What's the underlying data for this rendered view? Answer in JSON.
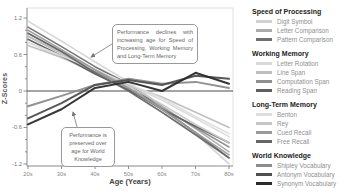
{
  "figure": {
    "y_axis": {
      "label": "Z-Scores",
      "tick_values": [
        1.2,
        0.6,
        0,
        -0.6,
        -1.2
      ],
      "tick_labels": [
        "1.2",
        "0.6",
        "0",
        "-0.6",
        "-1.2"
      ],
      "min": -1.2,
      "max": 1.2
    },
    "x_axis": {
      "label": "Age (Years)",
      "tick_labels": [
        "20s",
        "30s",
        "40s",
        "50s",
        "60s",
        "70s",
        "80s"
      ]
    },
    "annotations": [
      {
        "id": "decline",
        "text": "Performance declines with increasing age for Speed of Processing, Working Memory and Long-Term Memory"
      },
      {
        "id": "preserved",
        "text": "Performance is preserved over age for World Knowledge"
      }
    ],
    "zero_line_color": "#4a4a4a",
    "axis_color": "#999999",
    "frame_color": "#cccccc"
  },
  "chart_data": {
    "type": "line",
    "title": "",
    "xlabel": "Age (Years)",
    "ylabel": "Z-Scores",
    "x": [
      "20s",
      "30s",
      "40s",
      "50s",
      "60s",
      "70s",
      "80s"
    ],
    "ylim": [
      -1.2,
      1.2
    ],
    "grid": false,
    "legend_position": "right",
    "groups": [
      {
        "name": "Speed of Processing",
        "series": [
          {
            "name": "Digit Symbol",
            "color": "#d2d2d2",
            "width": 1.6,
            "values": [
              1.15,
              0.82,
              0.48,
              0.15,
              -0.25,
              -0.7,
              -1.2
            ]
          },
          {
            "name": "Letter Comparison",
            "color": "#ababab",
            "width": 1.6,
            "values": [
              0.95,
              0.65,
              0.35,
              0.1,
              -0.25,
              -0.62,
              -1.0
            ]
          },
          {
            "name": "Pattern Comparison",
            "color": "#6f6f6f",
            "width": 1.6,
            "values": [
              1.05,
              0.73,
              0.4,
              0.12,
              -0.3,
              -0.68,
              -1.1
            ]
          }
        ]
      },
      {
        "name": "Working Memory",
        "series": [
          {
            "name": "Letter Rotation",
            "color": "#d8d8d8",
            "width": 1.6,
            "values": [
              0.8,
              0.55,
              0.3,
              0.1,
              -0.15,
              -0.45,
              -0.75
            ]
          },
          {
            "name": "Line Span",
            "color": "#bdbdbd",
            "width": 1.6,
            "values": [
              0.75,
              0.55,
              0.32,
              0.1,
              -0.1,
              -0.35,
              -0.6
            ]
          },
          {
            "name": "Computation Span",
            "color": "#8f8f8f",
            "width": 1.6,
            "values": [
              0.9,
              0.62,
              0.32,
              0.05,
              -0.28,
              -0.6,
              -0.92
            ]
          },
          {
            "name": "Reading Span",
            "color": "#5f5f5f",
            "width": 1.6,
            "values": [
              0.85,
              0.58,
              0.28,
              0.02,
              -0.3,
              -0.58,
              -0.85
            ]
          }
        ]
      },
      {
        "name": "Long-Term Memory",
        "series": [
          {
            "name": "Benton",
            "color": "#dedede",
            "width": 1.6,
            "values": [
              0.8,
              0.58,
              0.35,
              0.12,
              -0.12,
              -0.42,
              -0.7
            ]
          },
          {
            "name": "Rey",
            "color": "#c6c6c6",
            "width": 1.6,
            "values": [
              0.9,
              0.62,
              0.35,
              0.08,
              -0.22,
              -0.55,
              -0.85
            ]
          },
          {
            "name": "Cued Recall",
            "color": "#9b9b9b",
            "width": 1.6,
            "values": [
              1.0,
              0.68,
              0.35,
              0.05,
              -0.3,
              -0.68,
              -1.05
            ]
          },
          {
            "name": "Free Recall",
            "color": "#666666",
            "width": 1.6,
            "values": [
              0.95,
              0.65,
              0.3,
              0.0,
              -0.35,
              -0.72,
              -1.1
            ]
          }
        ]
      },
      {
        "name": "World Knowledge",
        "series": [
          {
            "name": "Shipley Vocabulary",
            "color": "#8c8c8c",
            "width": 2.0,
            "values": [
              -0.25,
              -0.08,
              0.1,
              0.2,
              0.12,
              0.15,
              0.05
            ]
          },
          {
            "name": "Antonym Vocabulary",
            "color": "#4f4f4f",
            "width": 2.0,
            "values": [
              -0.45,
              -0.2,
              0.1,
              0.18,
              0.1,
              0.25,
              0.2
            ]
          },
          {
            "name": "Synonym Vocabulary",
            "color": "#2b2b2b",
            "width": 2.0,
            "values": [
              -0.55,
              -0.3,
              0.05,
              0.15,
              0.0,
              0.3,
              0.12
            ]
          }
        ]
      }
    ]
  }
}
